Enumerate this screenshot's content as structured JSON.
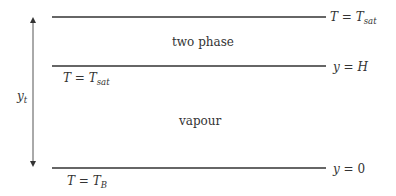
{
  "diagram": {
    "regions": {
      "upper": "two phase",
      "lower": "vapour"
    },
    "boundaries": {
      "top": {
        "right_label": {
          "lhs": "T",
          "eq": " = ",
          "rhs": "T",
          "rhs_sub": "sat"
        }
      },
      "middle": {
        "right_label": {
          "lhs": "y",
          "eq": " = ",
          "rhs": "H"
        },
        "below_label": {
          "lhs": "T",
          "eq": " = ",
          "rhs": "T",
          "rhs_sub": "sat"
        }
      },
      "bottom": {
        "right_label": {
          "lhs": "y",
          "eq": " = ",
          "rhs": "0"
        },
        "below_label": {
          "lhs": "T",
          "eq": " = ",
          "rhs": "T",
          "rhs_sub": "B"
        }
      }
    },
    "dimension": {
      "label": "y",
      "label_sub": "t"
    },
    "colors": {
      "line": "#333333",
      "text": "#333333"
    }
  }
}
